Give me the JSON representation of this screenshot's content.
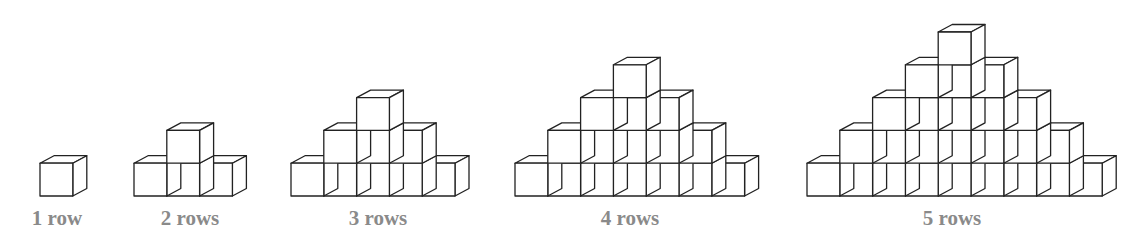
{
  "figure": {
    "stroke_color": "#222222",
    "label_color": "#8a8a8a",
    "cube": {
      "size": 32.8,
      "depth_dx": 14,
      "depth_dy": -7.5
    },
    "baseline_y": 196,
    "pyramids": [
      {
        "rows": 1,
        "left_x": 40,
        "label": "1 row",
        "label_x": 57
      },
      {
        "rows": 2,
        "left_x": 134,
        "label": "2 rows",
        "label_x": 190
      },
      {
        "rows": 3,
        "left_x": 291,
        "label": "3 rows",
        "label_x": 378
      },
      {
        "rows": 4,
        "left_x": 515,
        "label": "4 rows",
        "label_x": 630
      },
      {
        "rows": 5,
        "left_x": 807,
        "label": "5 rows",
        "label_x": 952
      }
    ]
  }
}
